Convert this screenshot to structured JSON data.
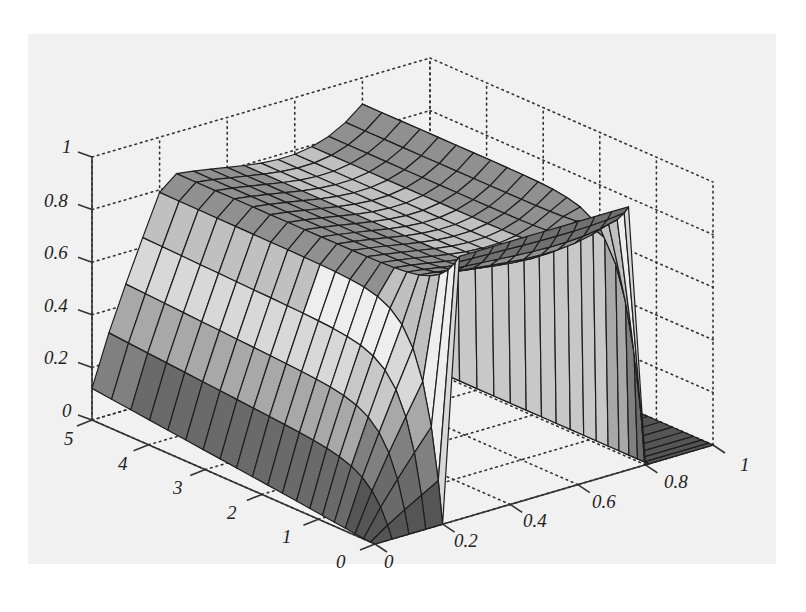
{
  "chart_data": {
    "type": "surface3d",
    "title": "",
    "xlabel": "",
    "ylabel": "",
    "zlabel": "",
    "x_ticks": [
      "0",
      "0.2",
      "0.4",
      "0.6",
      "0.8",
      "1"
    ],
    "y_ticks": [
      "0",
      "1",
      "2",
      "3",
      "4",
      "5"
    ],
    "z_ticks": [
      "0",
      "0.2",
      "0.4",
      "0.6",
      "0.8",
      "1"
    ],
    "xlim": [
      0,
      1
    ],
    "ylim": [
      0,
      5
    ],
    "zlim": [
      0,
      1
    ],
    "grid": true,
    "colormap": "gray",
    "samples": {
      "x": [
        0,
        0.2,
        0.3,
        0.5,
        0.7,
        0.8,
        1
      ],
      "y": [
        0,
        1,
        2,
        3,
        4,
        5
      ],
      "z": [
        [
          0.0,
          1.0,
          1.0,
          1.0,
          1.0,
          1.0,
          0.0
        ],
        [
          0.02,
          0.75,
          0.85,
          0.8,
          0.85,
          0.9,
          0.0
        ],
        [
          0.05,
          0.7,
          0.85,
          0.75,
          0.8,
          0.88,
          0.0
        ],
        [
          0.08,
          0.68,
          0.85,
          0.72,
          0.78,
          0.87,
          0.0
        ],
        [
          0.1,
          0.66,
          0.85,
          0.7,
          0.76,
          0.86,
          0.0
        ],
        [
          0.12,
          0.65,
          0.85,
          0.7,
          0.75,
          0.85,
          0.0
        ]
      ]
    }
  },
  "axes": {
    "z_labels": [
      "0",
      "0.2",
      "0.4",
      "0.6",
      "0.8",
      "1"
    ],
    "y_labels": [
      "0",
      "1",
      "2",
      "3",
      "4",
      "5"
    ],
    "x_labels": [
      "0",
      "0.2",
      "0.4",
      "0.6",
      "0.8",
      "1"
    ]
  }
}
